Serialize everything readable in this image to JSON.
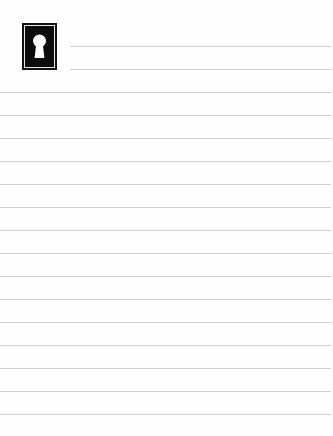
{
  "page": {
    "type": "lined-notepaper",
    "background_color": "#fefefe",
    "line_color": "#cfcfcf",
    "icon": {
      "name": "keyhole-icon",
      "frame_color": "#111111",
      "glyph_color": "#ffffff"
    },
    "header_lines": [
      {
        "y": 46,
        "x_start": 70,
        "x_end": 331
      },
      {
        "y": 69,
        "x_start": 70,
        "x_end": 331
      }
    ],
    "body_lines": [
      {
        "y": 92
      },
      {
        "y": 115
      },
      {
        "y": 138
      },
      {
        "y": 161
      },
      {
        "y": 184
      },
      {
        "y": 207
      },
      {
        "y": 230
      },
      {
        "y": 253
      },
      {
        "y": 276
      },
      {
        "y": 299
      },
      {
        "y": 322
      },
      {
        "y": 345
      },
      {
        "y": 368
      },
      {
        "y": 391
      },
      {
        "y": 414
      }
    ]
  }
}
